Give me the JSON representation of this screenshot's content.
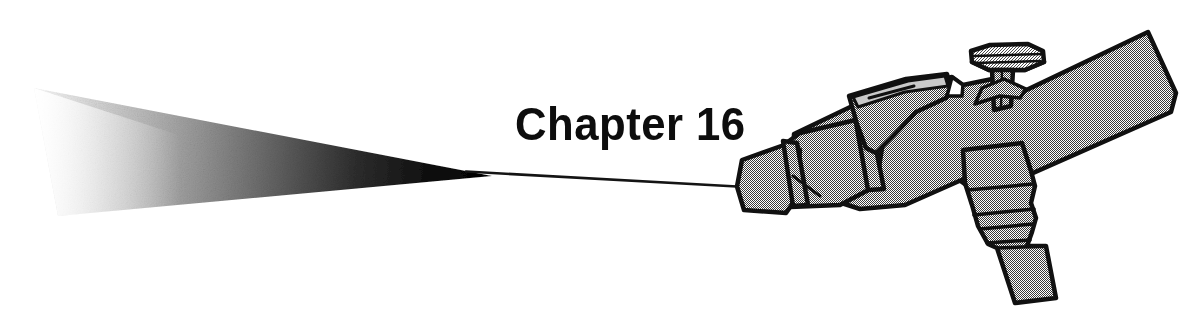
{
  "page": {
    "width": 1203,
    "height": 320,
    "background_color": "#ffffff",
    "kind": "book-chapter-opener-illustration"
  },
  "heading": {
    "text": "Chapter 16",
    "chapter_word": "Chapter",
    "chapter_number": "16",
    "color": "#0d0d0d",
    "style": "bold-condensed-sans"
  },
  "illustration": {
    "subject": "spray-gun-nozzle-with-spray-plume",
    "line_color": "#111111",
    "fill_color": "#9a9a9a",
    "fill_style": "50-percent-halftone-dither",
    "highlight_color": "#b0b0b0",
    "shadow_color": "#6f6f6f",
    "parts": [
      {
        "name": "spray-plume",
        "label": "Spray plume",
        "gradient_from": "#ffffff",
        "gradient_to": "#000000"
      },
      {
        "name": "jet-line",
        "label": "Fluid jet line"
      },
      {
        "name": "nozzle-tip",
        "label": "Nozzle tip"
      },
      {
        "name": "nozzle-ring-front",
        "label": "Front retaining ring"
      },
      {
        "name": "nozzle-ring-rear",
        "label": "Rear retaining ring"
      },
      {
        "name": "trigger-lever",
        "label": "Trigger lever"
      },
      {
        "name": "adjust-knob",
        "label": "Adjustment knob"
      },
      {
        "name": "knob-stem",
        "label": "Knob stem"
      },
      {
        "name": "gun-body",
        "label": "Gun body"
      },
      {
        "name": "handle",
        "label": "Handle"
      },
      {
        "name": "hose-connector",
        "label": "Stepped hose connector"
      }
    ]
  },
  "plume_geometry": {
    "top_left": [
      34,
      88
    ],
    "bottom_left": [
      58,
      215
    ],
    "apex": [
      492,
      176
    ],
    "description": "triangular wedge fading left to right from black at apex to near-white at the wide open end"
  }
}
